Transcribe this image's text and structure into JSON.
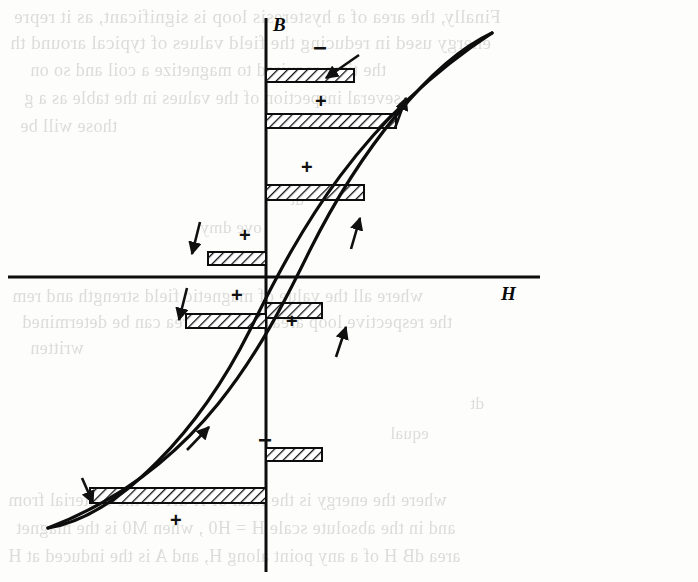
{
  "page": {
    "kind": "scanned-book-figure",
    "width": 698,
    "height": 582,
    "background_color": "#fdfdfc",
    "ink_color": "#0d0d0d",
    "bleed_color": "#dcdcd8"
  },
  "figure": {
    "axes": {
      "vertical": {
        "label": "B",
        "x": 266,
        "y_top": 18,
        "y_bottom": 572,
        "label_x": 273,
        "label_y": 14
      },
      "horizontal": {
        "label": "H",
        "y": 277,
        "x_left": 8,
        "x_right": 540,
        "label_x": 501,
        "label_y": 283
      }
    },
    "curves": {
      "ascending_branch": "M 48,528 C 120,516 200,430 250,330 C 300,228 360,120 492,33",
      "descending_branch": "M 492,33 C 430,62 360,150 310,250 C 262,348 200,470 48,528",
      "stroke_width": 3.2
    },
    "hatch_bands": [
      {
        "id": "band-1",
        "x": 266,
        "y": 69,
        "width": 88,
        "height": 13,
        "sign": null
      },
      {
        "id": "band-2",
        "x": 266,
        "y": 114,
        "width": 130,
        "height": 14,
        "sign": null
      },
      {
        "id": "band-3",
        "x": 266,
        "y": 185,
        "width": 98,
        "height": 15,
        "sign": null
      },
      {
        "id": "band-4",
        "x": 208,
        "y": 252,
        "width": 58,
        "height": 13,
        "sign": null
      },
      {
        "id": "band-5",
        "x": 266,
        "y": 303,
        "width": 56,
        "height": 15,
        "sign": null
      },
      {
        "id": "band-6",
        "x": 186,
        "y": 314,
        "width": 80,
        "height": 14,
        "sign": null
      },
      {
        "id": "band-7",
        "x": 266,
        "y": 448,
        "width": 56,
        "height": 13,
        "sign": null
      },
      {
        "id": "band-8",
        "x": 90,
        "y": 488,
        "width": 176,
        "height": 15,
        "sign": null
      }
    ],
    "signs": [
      {
        "id": "sign-minus-top",
        "symbol": "−",
        "x": 313,
        "y": 36
      },
      {
        "id": "sign-plus-upper",
        "symbol": "+",
        "x": 315,
        "y": 91
      },
      {
        "id": "sign-plus-mid-r",
        "symbol": "+",
        "x": 301,
        "y": 157
      },
      {
        "id": "sign-plus-mid-l",
        "symbol": "+",
        "x": 239,
        "y": 225
      },
      {
        "id": "sign-plus-below-ax",
        "symbol": "+",
        "x": 231,
        "y": 285
      },
      {
        "id": "sign-plus-lower-r",
        "symbol": "+",
        "x": 286,
        "y": 311
      },
      {
        "id": "sign-minus-lower",
        "symbol": "−",
        "x": 258,
        "y": 428
      },
      {
        "id": "sign-plus-bottom",
        "symbol": "+",
        "x": 170,
        "y": 510
      }
    ],
    "direction_arrows": [
      {
        "id": "arrow-down-upper-right",
        "direction": "down-left",
        "x1": 359,
        "y1": 55,
        "x2": 326,
        "y2": 78
      },
      {
        "id": "arrow-up-upper-right",
        "direction": "up-right",
        "x1": 395,
        "y1": 128,
        "x2": 406,
        "y2": 98
      },
      {
        "id": "arrow-up-mid-right",
        "direction": "up-right",
        "x1": 351,
        "y1": 249,
        "x2": 360,
        "y2": 218
      },
      {
        "id": "arrow-down-mid-left",
        "direction": "down-left",
        "x1": 200,
        "y1": 222,
        "x2": 192,
        "y2": 254
      },
      {
        "id": "arrow-down-low-left",
        "direction": "down-left",
        "x1": 187,
        "y1": 288,
        "x2": 179,
        "y2": 320
      },
      {
        "id": "arrow-up-low-right",
        "direction": "up-right",
        "x1": 336,
        "y1": 357,
        "x2": 346,
        "y2": 327
      },
      {
        "id": "arrow-up-bottom",
        "direction": "up-right",
        "x1": 187,
        "y1": 450,
        "x2": 209,
        "y2": 427
      },
      {
        "id": "arrow-down-bottom-left",
        "direction": "down-left",
        "x1": 82,
        "y1": 478,
        "x2": 93,
        "y2": 503
      }
    ]
  },
  "bleed_text": {
    "description": "Faint mirrored show-through text from the reverse side of the page",
    "lines": [
      {
        "id": "bleed-1",
        "text": "Finally, the area of a hysteresis loop is significant, as it repre",
        "x": 14,
        "y": 6,
        "size": 19
      },
      {
        "id": "bleed-2",
        "text": "energy used in reducing the field values of typical around th",
        "x": 10,
        "y": 32,
        "size": 19
      },
      {
        "id": "bleed-3",
        "text": "the time required to magnetize a coil and so on",
        "x": 30,
        "y": 60,
        "size": 18
      },
      {
        "id": "bleed-4",
        "text": "several inspection of the values in the table as a g",
        "x": 24,
        "y": 88,
        "size": 18
      },
      {
        "id": "bleed-5",
        "text": "those will be",
        "x": 20,
        "y": 116,
        "size": 18
      },
      {
        "id": "bleed-6",
        "text": "dt",
        "x": 290,
        "y": 190,
        "size": 17
      },
      {
        "id": "bleed-7",
        "text": "ove dmy",
        "x": 200,
        "y": 218,
        "size": 17
      },
      {
        "id": "bleed-8",
        "text": "where all the value of  magnetic field strength and rem",
        "x": 12,
        "y": 286,
        "size": 18
      },
      {
        "id": "bleed-9",
        "text": "the respective loop area. Such an area can be determined",
        "x": 22,
        "y": 312,
        "size": 18
      },
      {
        "id": "bleed-10",
        "text": "written",
        "x": 30,
        "y": 338,
        "size": 18
      },
      {
        "id": "bleed-11",
        "text": "dt",
        "x": 470,
        "y": 394,
        "size": 17
      },
      {
        "id": "bleed-12",
        "text": "equal",
        "x": 390,
        "y": 424,
        "size": 17
      },
      {
        "id": "bleed-13",
        "text": "where the energy is the total of H dH of the material from",
        "x": 8,
        "y": 490,
        "size": 18
      },
      {
        "id": "bleed-14",
        "text": "and in the absolute scale H = H0 , when M0 is the magnet",
        "x": 16,
        "y": 518,
        "size": 18
      },
      {
        "id": "bleed-15",
        "text": "area dB H of  a  any point along H, and  A  is the induced at H",
        "x": 8,
        "y": 546,
        "size": 18
      }
    ]
  }
}
